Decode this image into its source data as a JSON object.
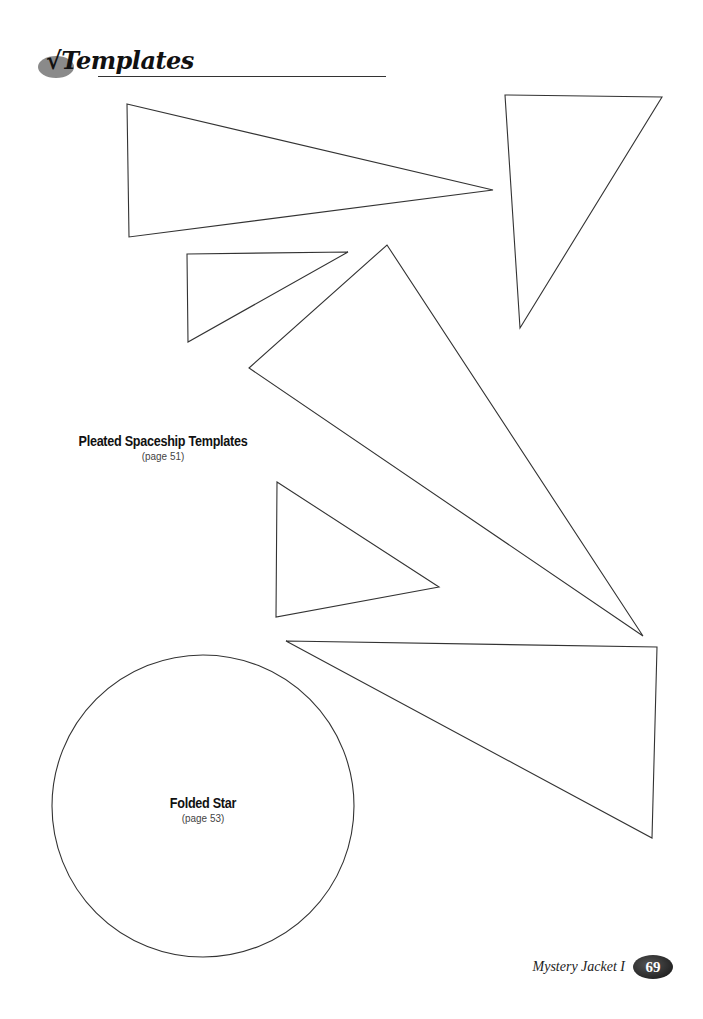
{
  "header": {
    "check_glyph": "√",
    "title": "Templates"
  },
  "sections": [
    {
      "title": "Pleated Spaceship Templates",
      "page_ref": "(page 51)"
    },
    {
      "title": "Folded Star",
      "page_ref": "(page 53)"
    }
  ],
  "shapes": {
    "triangles": [
      {
        "name": "spaceship-triangle-1",
        "points": "127,104 493,190 129,237"
      },
      {
        "name": "spaceship-triangle-2",
        "points": "505,95 662,97 520,328"
      },
      {
        "name": "spaceship-triangle-3",
        "points": "187,254 348,252 188,342"
      },
      {
        "name": "spaceship-triangle-4",
        "points": "387,245 643,636 249,368"
      },
      {
        "name": "spaceship-triangle-5",
        "points": "277,482 439,587 276,617"
      },
      {
        "name": "spaceship-triangle-6",
        "points": "286,641 657,647 652,838"
      }
    ],
    "circle": {
      "name": "folded-star-circle",
      "cx": 203,
      "cy": 806,
      "r": 151
    },
    "stroke_color": "#333333"
  },
  "footer": {
    "book_title": "Mystery Jacket I",
    "page_number": "69"
  }
}
